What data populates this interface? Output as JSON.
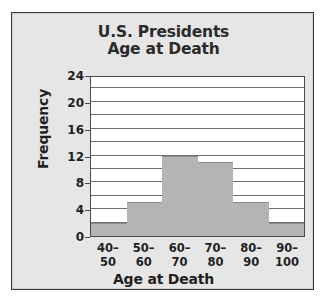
{
  "chart_data": {
    "type": "bar",
    "title": "U.S. Presidents Age at Death",
    "title_lines": [
      "U.S. Presidents",
      "Age at Death"
    ],
    "xlabel": "Age at Death",
    "ylabel": "Frequency",
    "categories": [
      "40-50",
      "50-60",
      "60-70",
      "70-80",
      "80-90",
      "90-100"
    ],
    "category_lines": [
      {
        "lo": "40–",
        "hi": "50"
      },
      {
        "lo": "50–",
        "hi": "60"
      },
      {
        "lo": "60–",
        "hi": "70"
      },
      {
        "lo": "70–",
        "hi": "80"
      },
      {
        "lo": "80–",
        "hi": "90"
      },
      {
        "lo": "90–",
        "hi": "100"
      }
    ],
    "values": [
      2,
      5,
      12,
      11,
      5,
      2
    ],
    "ylim": [
      0,
      24
    ],
    "ytick_labels": [
      "0",
      "4",
      "8",
      "12",
      "16",
      "20",
      "24"
    ],
    "ytick_values": [
      0,
      4,
      8,
      12,
      16,
      20,
      24
    ],
    "gridline_values": [
      2,
      4,
      6,
      8,
      10,
      12,
      14,
      16,
      18,
      20,
      22
    ],
    "grid": true,
    "legend": "none",
    "colors": {
      "bar_fill": "#b4b4b4",
      "bar_edge": "#8d8d8d",
      "plot_background": "#ffffff",
      "figure_background": "#e6e6e6",
      "frame_border": "#3a3a3a",
      "gridline": "#6e6e6e",
      "text": "#1f1f1f",
      "title_text": "#2b2b2b"
    }
  }
}
